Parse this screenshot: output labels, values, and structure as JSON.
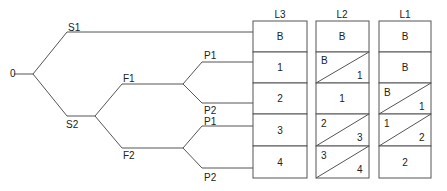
{
  "tree": {
    "root": "0",
    "level1": [
      "S1",
      "S2"
    ],
    "level2": [
      "F1",
      "F2"
    ],
    "level3_f1": [
      "P1",
      "P2"
    ],
    "level3_f2": [
      "P1",
      "P2"
    ]
  },
  "columns": [
    {
      "header": "L3",
      "cells": [
        {
          "type": "single",
          "value": "B"
        },
        {
          "type": "single",
          "value": "1"
        },
        {
          "type": "single",
          "value": "2"
        },
        {
          "type": "single",
          "value": "3"
        },
        {
          "type": "single",
          "value": "4"
        }
      ]
    },
    {
      "header": "L2",
      "cells": [
        {
          "type": "single",
          "value": "B"
        },
        {
          "type": "split",
          "top": "B",
          "bottom": "1"
        },
        {
          "type": "single",
          "value": "1"
        },
        {
          "type": "split",
          "top": "2",
          "bottom": "3"
        },
        {
          "type": "split",
          "top": "3",
          "bottom": "4"
        }
      ]
    },
    {
      "header": "L1",
      "cells": [
        {
          "type": "single",
          "value": "B"
        },
        {
          "type": "single",
          "value": "B"
        },
        {
          "type": "split",
          "top": "B",
          "bottom": "1"
        },
        {
          "type": "split",
          "top": "1",
          "bottom": "2"
        },
        {
          "type": "single",
          "value": "2"
        }
      ]
    }
  ]
}
